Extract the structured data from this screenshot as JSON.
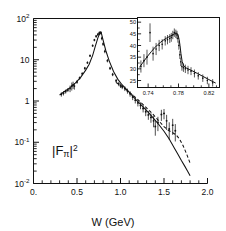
{
  "figure": {
    "name": "pion-form-factor-plot",
    "background": "#ffffff",
    "ink": "#111111"
  },
  "chart_data": {
    "type": "scatter",
    "title": "",
    "xlabel": "W  (GeV)",
    "ylabel": "|Fπ|²",
    "annotation": "|Fπ|²",
    "xscale": "linear",
    "yscale": "log",
    "xlim": [
      0.0,
      2.0
    ],
    "ylim": [
      0.01,
      100
    ],
    "grid": false,
    "legend": "none",
    "xticks": [
      0.0,
      0.5,
      1.0,
      1.5,
      2.0
    ],
    "xticklabels": [
      "0.",
      "0.5",
      "1.0",
      "1.5",
      "2.0"
    ],
    "xminorticks": [
      0.1,
      0.2,
      0.3,
      0.4,
      0.6,
      0.7,
      0.8,
      0.9,
      1.1,
      1.2,
      1.3,
      1.4,
      1.6,
      1.7,
      1.8,
      1.9
    ],
    "yticks": [
      0.01,
      0.1,
      1,
      10,
      100
    ],
    "yticklabels": [
      "10⁻²",
      "10⁻¹",
      "1",
      "10",
      "10²"
    ],
    "series": [
      {
        "name": "data",
        "style": "points-with-errorbars",
        "x": [
          0.32,
          0.345,
          0.37,
          0.395,
          0.42,
          0.44,
          0.455,
          0.47,
          0.5,
          0.53,
          0.56,
          0.59,
          0.62,
          0.65,
          0.68,
          0.7,
          0.72,
          0.74,
          0.755,
          0.765,
          0.775,
          0.785,
          0.8,
          0.82,
          0.85,
          0.88,
          0.91,
          0.95,
          0.98,
          1.0,
          1.02,
          1.05,
          1.08,
          1.11,
          1.14,
          1.17,
          1.2,
          1.23,
          1.26,
          1.29,
          1.32,
          1.35,
          1.38,
          1.4,
          1.43,
          1.47,
          1.5,
          1.53,
          1.56,
          1.6,
          1.63
        ],
        "y": [
          1.45,
          1.55,
          1.7,
          1.85,
          2.0,
          2.3,
          2.45,
          2.3,
          2.9,
          3.6,
          4.6,
          6.2,
          8.5,
          12.5,
          22.0,
          30.0,
          37.0,
          41.0,
          44.0,
          45.5,
          45.0,
          33.0,
          24.0,
          16.0,
          9.5,
          6.2,
          4.4,
          3.1,
          2.6,
          2.35,
          2.2,
          2.0,
          1.75,
          1.5,
          1.25,
          1.05,
          0.9,
          0.78,
          0.66,
          0.55,
          0.46,
          0.4,
          0.33,
          0.24,
          0.3,
          0.47,
          0.5,
          0.33,
          0.21,
          0.26,
          0.19
        ],
        "yerr_rel": [
          0.12,
          0.12,
          0.11,
          0.11,
          0.18,
          0.22,
          0.2,
          0.18,
          0.1,
          0.09,
          0.08,
          0.08,
          0.07,
          0.07,
          0.07,
          0.07,
          0.08,
          0.09,
          0.09,
          0.09,
          0.09,
          0.1,
          0.1,
          0.1,
          0.09,
          0.09,
          0.09,
          0.1,
          0.12,
          0.12,
          0.12,
          0.13,
          0.14,
          0.15,
          0.16,
          0.17,
          0.18,
          0.19,
          0.2,
          0.22,
          0.24,
          0.26,
          0.3,
          0.4,
          0.38,
          0.3,
          0.28,
          0.4,
          0.45,
          0.42,
          0.45
        ]
      },
      {
        "name": "solid-curve",
        "style": "solid-line",
        "x": [
          0.3,
          0.36,
          0.42,
          0.48,
          0.54,
          0.6,
          0.64,
          0.68,
          0.71,
          0.74,
          0.765,
          0.78,
          0.8,
          0.83,
          0.87,
          0.92,
          0.97,
          1.02,
          1.08,
          1.14,
          1.2,
          1.26,
          1.32,
          1.38,
          1.44,
          1.5,
          1.56,
          1.62,
          1.66,
          1.7,
          1.74,
          1.77,
          1.8
        ],
        "y": [
          1.4,
          1.72,
          2.1,
          2.72,
          3.7,
          5.6,
          7.8,
          12.8,
          21.0,
          34.0,
          45.0,
          44.0,
          30.0,
          17.0,
          9.4,
          5.2,
          3.35,
          2.45,
          1.8,
          1.32,
          0.96,
          0.72,
          0.53,
          0.38,
          0.27,
          0.185,
          0.12,
          0.072,
          0.051,
          0.036,
          0.026,
          0.02,
          0.0155
        ]
      },
      {
        "name": "dashed-curve",
        "style": "dashed-line",
        "x": [
          0.95,
          1.02,
          1.08,
          1.14,
          1.2,
          1.26,
          1.32,
          1.38,
          1.44,
          1.5,
          1.55,
          1.6,
          1.64,
          1.68,
          1.72,
          1.76,
          1.8
        ],
        "y": [
          2.8,
          2.25,
          1.78,
          1.4,
          1.08,
          0.82,
          0.62,
          0.46,
          0.33,
          0.24,
          0.195,
          0.17,
          0.15,
          0.118,
          0.082,
          0.052,
          0.031
        ]
      }
    ]
  },
  "inset_data": {
    "type": "scatter",
    "title": "",
    "xlabel": "",
    "ylabel": "",
    "xscale": "linear",
    "yscale": "linear",
    "xlim": [
      0.726,
      0.834
    ],
    "ylim": [
      22.0,
      52.0
    ],
    "grid": false,
    "xticks": [
      0.74,
      0.78,
      0.82
    ],
    "xticklabels": [
      "0.74",
      "0.78",
      "0.82"
    ],
    "xminorticks": [
      0.75,
      0.76,
      0.77,
      0.79,
      0.8,
      0.81,
      0.83
    ],
    "yticks": [
      25,
      30,
      35,
      40,
      45,
      50
    ],
    "yticklabels": [
      "25",
      "30",
      "35",
      "40",
      "45",
      "50"
    ],
    "series": [
      {
        "name": "data",
        "style": "points-with-errorbars",
        "x": [
          0.7305,
          0.7345,
          0.7385,
          0.7425,
          0.7465,
          0.7505,
          0.7545,
          0.7585,
          0.7625,
          0.7655,
          0.7685,
          0.7705,
          0.7725,
          0.7745,
          0.7765,
          0.778,
          0.7792,
          0.7805,
          0.7818,
          0.783,
          0.7845,
          0.7865,
          0.789,
          0.7925,
          0.7965,
          0.801,
          0.806,
          0.812,
          0.818,
          0.825
        ],
        "y": [
          31.0,
          33.5,
          35.0,
          45.5,
          36.5,
          38.5,
          40.0,
          40.5,
          42.0,
          42.5,
          43.0,
          43.5,
          44.5,
          45.5,
          45.0,
          44.5,
          43.0,
          40.0,
          36.0,
          33.0,
          31.0,
          30.5,
          30.0,
          29.5,
          29.0,
          28.0,
          27.0,
          26.0,
          25.0,
          24.0
        ],
        "yerr": [
          2.6,
          2.8,
          3.2,
          4.0,
          3.0,
          2.6,
          2.4,
          2.2,
          2.0,
          2.0,
          1.9,
          1.9,
          1.8,
          1.8,
          1.8,
          1.8,
          1.8,
          1.8,
          1.8,
          1.8,
          1.8,
          1.8,
          1.8,
          1.8,
          1.7,
          1.7,
          1.6,
          1.6,
          1.6,
          1.6
        ]
      },
      {
        "name": "curve",
        "style": "solid-line",
        "x": [
          0.7285,
          0.7325,
          0.7365,
          0.7405,
          0.7445,
          0.7485,
          0.7525,
          0.7565,
          0.7605,
          0.7645,
          0.7685,
          0.7715,
          0.7745,
          0.7765,
          0.7782,
          0.7795,
          0.7808,
          0.782,
          0.7832,
          0.7848,
          0.787,
          0.79,
          0.794,
          0.799,
          0.805,
          0.812,
          0.82,
          0.829
        ],
        "y": [
          30.6,
          32.4,
          34.2,
          35.9,
          37.5,
          39.0,
          40.3,
          41.4,
          42.4,
          43.2,
          43.9,
          44.4,
          45.0,
          45.3,
          45.2,
          44.4,
          42.6,
          40.0,
          36.6,
          33.2,
          31.2,
          30.4,
          29.8,
          29.0,
          28.0,
          26.8,
          25.4,
          23.9
        ]
      }
    ]
  }
}
